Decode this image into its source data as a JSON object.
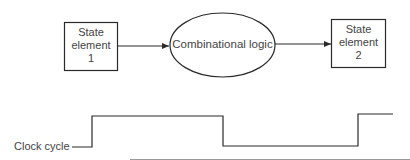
{
  "diagram": {
    "state_element_1": {
      "line1": "State",
      "line2": "element",
      "line3": "1"
    },
    "combinational_logic": {
      "label": "Combinational logic"
    },
    "state_element_2": {
      "line1": "State",
      "line2": "element",
      "line3": "2"
    },
    "clock": {
      "label": "Clock cycle"
    }
  },
  "colors": {
    "stroke": "#2a2a2a",
    "text": "#444444",
    "baseline": "#9a9a9a"
  }
}
